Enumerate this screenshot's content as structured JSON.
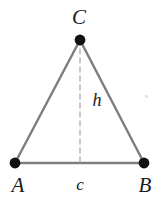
{
  "figure": {
    "kind": "geometry-diagram",
    "canvas": {
      "width": 167,
      "height": 203,
      "background": "#ffffff"
    },
    "style": {
      "side_color": "#7d7d7d",
      "base_color": "#7d7d7d",
      "dash_color": "#b3b3b3",
      "vertex_dot_color": "#111111",
      "label_color": "#1a1a1a",
      "side_width": 2.4,
      "base_width": 2.4,
      "dash_width": 1.4,
      "dash_pattern": "5 4",
      "vertex_dot_radius": 5.4
    },
    "vertices": [
      {
        "id": "A",
        "label": "A",
        "x": 15,
        "y": 163,
        "label_x": 18,
        "label_y": 185
      },
      {
        "id": "B",
        "label": "B",
        "x": 144,
        "y": 163,
        "label_x": 145,
        "label_y": 185
      },
      {
        "id": "C",
        "label": "C",
        "x": 80,
        "y": 40,
        "label_x": 79,
        "label_y": 17
      }
    ],
    "edges": [
      {
        "id": "AC",
        "from": "A",
        "to": "C",
        "style": "solid"
      },
      {
        "id": "CB",
        "from": "C",
        "to": "B",
        "style": "solid"
      },
      {
        "id": "AB",
        "from": "A",
        "to": "B",
        "style": "solid"
      }
    ],
    "altitude": {
      "id": "h",
      "label": "h",
      "from": "C",
      "foot_x": 80,
      "foot_y": 163,
      "style": "dashed",
      "label_x": 97,
      "label_y": 100
    },
    "base_label": {
      "id": "c",
      "label": "c",
      "label_x": 80,
      "label_y": 184
    },
    "artifacts": [
      {
        "id": "speck",
        "x": 145,
        "y": 95
      }
    ]
  }
}
